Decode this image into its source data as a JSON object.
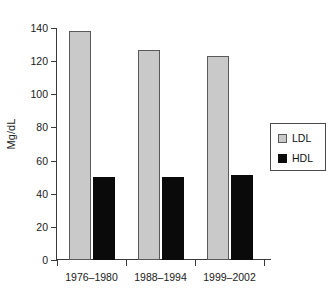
{
  "chart_data": {
    "type": "bar",
    "title": "",
    "subtitle": "",
    "xlabel": "",
    "ylabel": "Mg/dL",
    "categories": [
      "1976–1980",
      "1988–1994",
      "1999–2002"
    ],
    "series": [
      {
        "name": "LDL",
        "values": [
          138,
          127,
          123
        ],
        "color": "#c9c9c9"
      },
      {
        "name": "HDL",
        "values": [
          50,
          50,
          51
        ],
        "color": "#0a0a0a"
      }
    ],
    "ylim": [
      0,
      140
    ],
    "ytick_step": 20,
    "ytick_labels": [
      "0",
      "20",
      "40",
      "60",
      "80",
      "100",
      "120",
      "140"
    ],
    "grid": false,
    "legend_position": "right"
  },
  "legend": {
    "entries": [
      {
        "label": "LDL",
        "swatch": "light-gray"
      },
      {
        "label": "HDL",
        "swatch": "black"
      }
    ]
  },
  "axes": {
    "y_title": "Mg/dL",
    "y_ticks": [
      "140",
      "120",
      "100",
      "80",
      "60",
      "40",
      "20",
      "0"
    ],
    "x_ticks": [
      "1976–1980",
      "1988–1994",
      "1999–2002"
    ]
  }
}
